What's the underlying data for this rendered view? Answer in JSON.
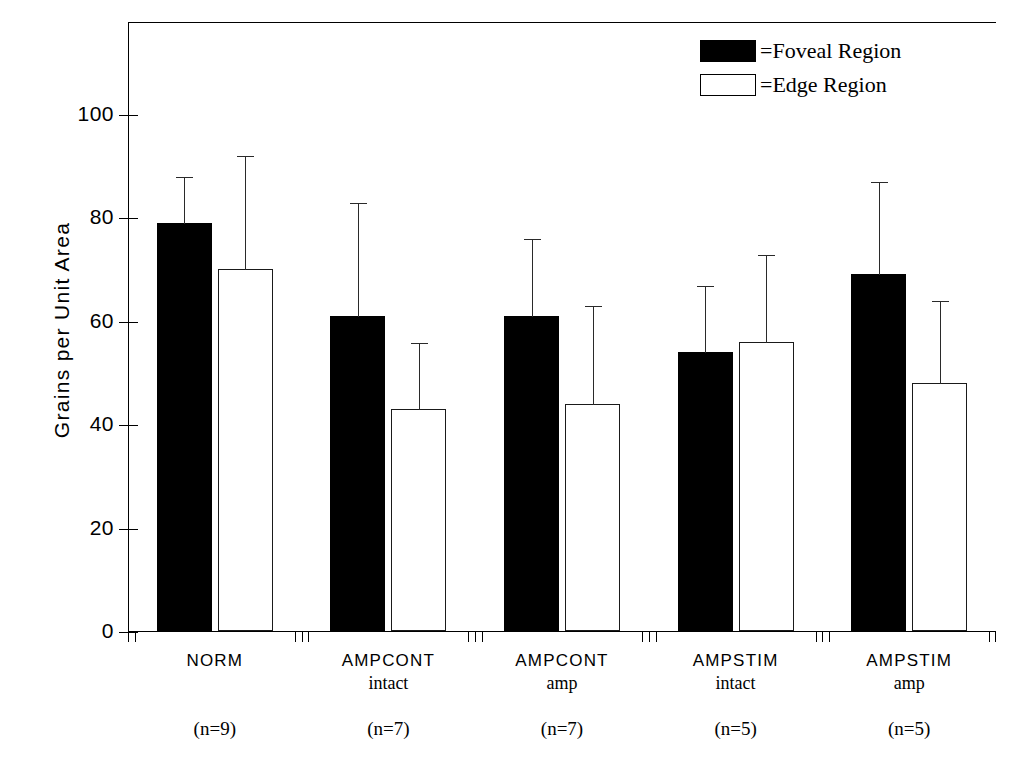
{
  "chart_data": {
    "type": "bar",
    "title": "",
    "xlabel": "",
    "ylabel": "Grains per Unit Area",
    "ylim": [
      0,
      118
    ],
    "yticks": [
      0,
      20,
      40,
      60,
      80,
      100
    ],
    "ytick_labels": [
      "0",
      "20",
      "40",
      "60",
      "80",
      "100"
    ],
    "grid": false,
    "legend_position": "top-right",
    "error_bars": "upper only",
    "categories": [
      {
        "main": "NORM",
        "sub": "",
        "n_label": "(n=9)",
        "n": 9
      },
      {
        "main": "AMPCONT",
        "sub": "intact",
        "n_label": "(n=7)",
        "n": 7
      },
      {
        "main": "AMPCONT",
        "sub": "amp",
        "n_label": "(n=7)",
        "n": 7
      },
      {
        "main": "AMPSTIM",
        "sub": "intact",
        "n_label": "(n=5)",
        "n": 5
      },
      {
        "main": "AMPSTIM",
        "sub": "amp",
        "n_label": "(n=5)",
        "n": 5
      }
    ],
    "series": [
      {
        "name": "=Foveal Region",
        "key": "foveal",
        "color": "#000000",
        "fill": "solid",
        "values": [
          79,
          61,
          61,
          54,
          69
        ],
        "error_upper": [
          9,
          22,
          15,
          13,
          18
        ],
        "error_top": [
          88,
          83,
          76,
          67,
          87
        ]
      },
      {
        "name": "=Edge Region",
        "key": "edge",
        "color": "#ffffff",
        "fill": "open",
        "values": [
          70,
          43,
          44,
          56,
          48
        ],
        "error_upper": [
          22,
          13,
          19,
          17,
          16
        ],
        "error_top": [
          92,
          56,
          63,
          73,
          64
        ]
      }
    ]
  },
  "legend": {
    "items": [
      {
        "label": "=Foveal Region",
        "swatch": "foveal"
      },
      {
        "label": "=Edge Region",
        "swatch": "edge"
      }
    ]
  },
  "axis": {
    "y_title": "Grains per Unit Area"
  },
  "colors": {
    "foreground": "#000000",
    "background": "#ffffff",
    "foveal": "#000000",
    "edge": "#ffffff"
  }
}
